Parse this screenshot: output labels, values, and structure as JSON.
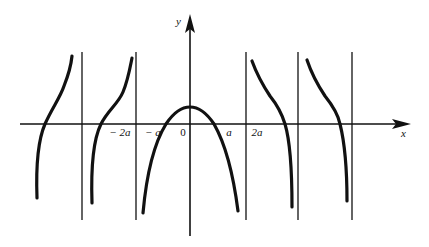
{
  "diagram": {
    "type": "function-graph",
    "axes": {
      "x_label": "x",
      "y_label": "y"
    },
    "tick_labels": {
      "neg_2a": "− 2a",
      "neg_a": "− a",
      "zero": "0",
      "pos_a": "a",
      "pos_2a": "2a"
    },
    "asymptotes": [
      "far-left",
      "-2a",
      "2a",
      "mid-right",
      "far-right"
    ],
    "curves": [
      {
        "name": "left-branch-1",
        "shape": "increasing"
      },
      {
        "name": "left-branch-2",
        "shape": "increasing"
      },
      {
        "name": "central-arch",
        "shape": "arch peaking at x=0, zeros near ±a/2"
      },
      {
        "name": "right-branch-1",
        "shape": "decreasing"
      },
      {
        "name": "right-branch-2",
        "shape": "decreasing"
      }
    ],
    "colors": {
      "line": "#111111",
      "background": "#ffffff"
    }
  }
}
